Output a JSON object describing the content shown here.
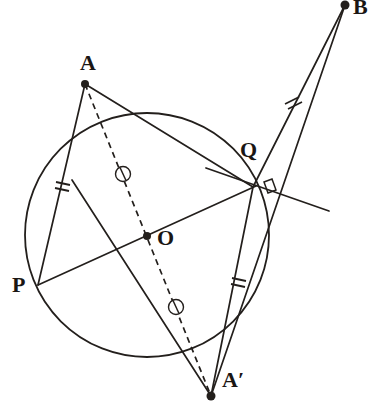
{
  "figure": {
    "stroke_color": "#231f1c",
    "background_color": "#ffffff",
    "width": 376,
    "height": 412
  },
  "circle": {
    "name": "main-circle",
    "center": {
      "x": 147,
      "y": 235
    },
    "radius": 122,
    "stroke_width": 1.8
  },
  "points": [
    {
      "id": "A",
      "label": "A",
      "x": 85,
      "y": 84,
      "dot": true,
      "label_x": 80,
      "label_y": 52
    },
    {
      "id": "B",
      "label": "B",
      "x": 345,
      "y": 5,
      "dot": true,
      "label_x": 353,
      "label_y": -5
    },
    {
      "id": "P",
      "label": "P",
      "x": 38,
      "y": 285,
      "dot": false,
      "label_x": 12,
      "label_y": 275
    },
    {
      "id": "Q",
      "label": "Q",
      "x": 253,
      "y": 187,
      "dot": false,
      "label_x": 240,
      "label_y": 138
    },
    {
      "id": "O",
      "label": "O",
      "x": 147,
      "y": 236,
      "dot": true,
      "label_x": 157,
      "label_y": 228
    },
    {
      "id": "Ap",
      "label": "A′",
      "x": 211,
      "y": 396,
      "dot": true,
      "label_x": 222,
      "label_y": 368
    }
  ],
  "segments": [
    {
      "name": "segment-AP",
      "from": "A",
      "to": "P",
      "style": "solid",
      "x1": 85,
      "y1": 84,
      "x2": 38,
      "y2": 285
    },
    {
      "name": "segment-AQ",
      "from": "A",
      "to": "Q",
      "style": "solid",
      "x1": 85,
      "y1": 84,
      "x2": 253,
      "y2": 187
    },
    {
      "name": "segment-PQ-diameter",
      "from": "P",
      "to": "Q",
      "style": "solid",
      "x1": 38,
      "y1": 285,
      "x2": 256,
      "y2": 186
    },
    {
      "name": "segment-QB",
      "from": "Q",
      "to": "B",
      "style": "solid",
      "x1": 253,
      "y1": 187,
      "x2": 345,
      "y2": 5
    },
    {
      "name": "segment-ApB",
      "from": "Ap",
      "to": "B",
      "style": "solid",
      "x1": 211,
      "y1": 396,
      "x2": 345,
      "y2": 5
    },
    {
      "name": "segment-QAp",
      "from": "Q",
      "to": "Ap",
      "style": "solid",
      "x1": 253,
      "y1": 187,
      "x2": 211,
      "y2": 396
    },
    {
      "name": "segment-PAp",
      "from": "P",
      "to": "Ap",
      "style": "solid",
      "x1": 72,
      "y1": 180,
      "x2": 211,
      "y2": 396
    },
    {
      "name": "segment-AAp-dashed",
      "from": "A",
      "to": "Ap",
      "style": "dashed",
      "x1": 85,
      "y1": 84,
      "x2": 211,
      "y2": 396
    }
  ],
  "tangent_line": {
    "name": "tangent-at-Q",
    "x1": 206,
    "y1": 168,
    "x2": 329,
    "y2": 211
  },
  "right_angle_marker": {
    "name": "right-angle-marker-at-Q",
    "vertex_x": 253,
    "vertex_y": 187,
    "size": 13
  },
  "tick_marks": [
    {
      "name": "tick-double-AP",
      "on_segment": "segment-AP",
      "count": 2,
      "x": 63,
      "y": 185,
      "angle": 103
    },
    {
      "name": "tick-double-QB",
      "on_segment": "segment-QB",
      "count": 2,
      "x": 293,
      "y": 100,
      "angle": 297
    },
    {
      "name": "tick-double-QAp",
      "on_segment": "segment-QAp",
      "count": 2,
      "x": 239,
      "y": 281,
      "angle": 101
    }
  ],
  "circle_markers": [
    {
      "name": "congruence-circle-marker-upper",
      "x": 123,
      "y": 174,
      "r": 7.5
    },
    {
      "name": "congruence-circle-marker-lower",
      "x": 176,
      "y": 307,
      "r": 7.5
    }
  ]
}
